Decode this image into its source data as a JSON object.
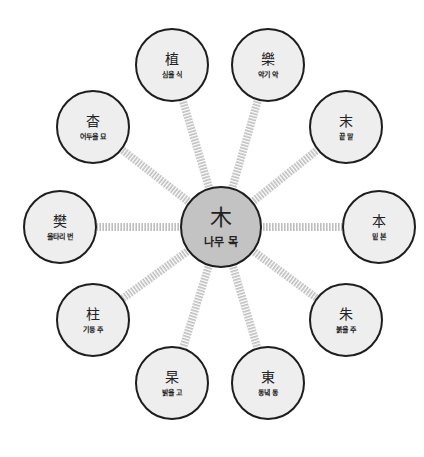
{
  "diagram": {
    "type": "radial-hanja-map",
    "colors": {
      "background": "#ffffff",
      "node_fill": "#eeeeee",
      "center_fill": "#c3c3c3",
      "node_border": "#1e1e1e",
      "connector_stripe": "#bdbdbd"
    },
    "center": {
      "hanja": "木",
      "meaning": "나무 목",
      "cx": 221,
      "cy": 227,
      "r": 41
    },
    "nodes": [
      {
        "hanja": "植",
        "meaning": "심을 식",
        "cx": 172,
        "cy": 65,
        "r": 37
      },
      {
        "hanja": "樂",
        "meaning": "악기 악",
        "cx": 268,
        "cy": 65,
        "r": 37
      },
      {
        "hanja": "末",
        "meaning": "끝 말",
        "cx": 346,
        "cy": 127,
        "r": 37
      },
      {
        "hanja": "本",
        "meaning": "밑 본",
        "cx": 379,
        "cy": 227,
        "r": 37
      },
      {
        "hanja": "朱",
        "meaning": "붉을 주",
        "cx": 346,
        "cy": 320,
        "r": 37
      },
      {
        "hanja": "東",
        "meaning": "동녘 동",
        "cx": 268,
        "cy": 383,
        "r": 37
      },
      {
        "hanja": "杲",
        "meaning": "밝을 고",
        "cx": 172,
        "cy": 383,
        "r": 37
      },
      {
        "hanja": "柱",
        "meaning": "기둥 주",
        "cx": 93,
        "cy": 320,
        "r": 37
      },
      {
        "hanja": "樊",
        "meaning": "울타리 번",
        "cx": 60,
        "cy": 227,
        "r": 37
      },
      {
        "hanja": "杳",
        "meaning": "어두울 묘",
        "cx": 93,
        "cy": 127,
        "r": 37
      }
    ]
  }
}
